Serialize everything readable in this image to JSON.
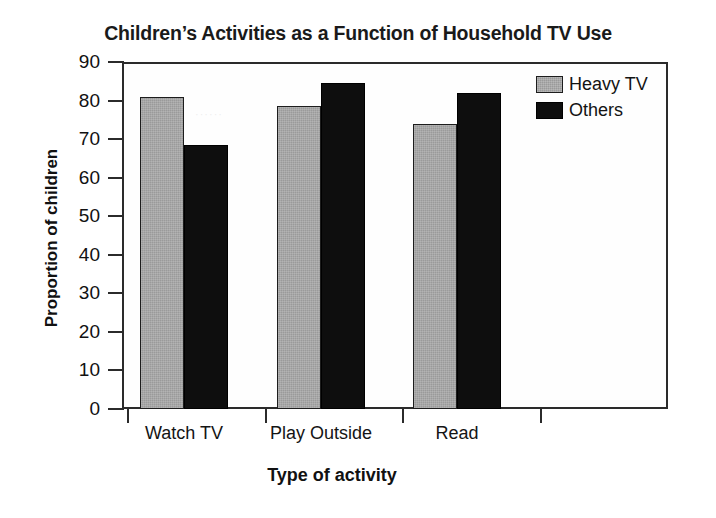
{
  "chart_data": {
    "type": "bar",
    "title": "Children’s Activities as a Function of Household TV Use",
    "xlabel": "Type of activity",
    "ylabel": "Proportion of children",
    "categories": [
      "Watch TV",
      "Play Outside",
      "Read"
    ],
    "series": [
      {
        "name": "Heavy TV",
        "color": "#9a9a9a",
        "values": [
          81,
          78.5,
          74
        ]
      },
      {
        "name": "Others",
        "color": "#0e0e0e",
        "values": [
          68.5,
          84.5,
          82
        ]
      }
    ],
    "ylim": [
      0,
      90
    ],
    "ytick_labels": [
      "90",
      "80",
      "70",
      "60",
      "50",
      "40",
      "30",
      "20",
      "10",
      "0"
    ],
    "ytick_values": [
      90,
      80,
      70,
      60,
      50,
      40,
      30,
      20,
      10,
      0
    ],
    "ystep": 10,
    "grid": false,
    "legend_position": "top-right",
    "legend_entries": [
      "Heavy TV",
      "Others"
    ]
  },
  "artifact": {
    "smudge": "······"
  }
}
